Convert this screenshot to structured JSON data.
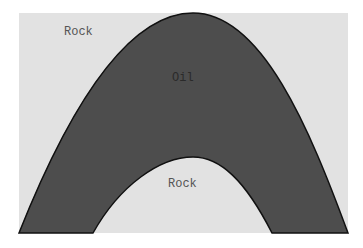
{
  "diagram": {
    "labels": {
      "top_rock": "Rock",
      "oil": "Oil",
      "bottom_rock": "Rock"
    },
    "colors": {
      "rock": "#e2e2e2",
      "oil": "#4d4d4d",
      "outline": "#111111",
      "label_on_light": "#555555",
      "label_on_dark": "#2a2a2a"
    }
  }
}
